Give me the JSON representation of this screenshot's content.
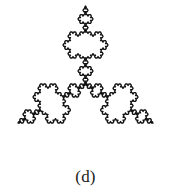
{
  "figure": {
    "caption": "(d)",
    "background_color": "#ffffff",
    "stroke_color": "#141414",
    "stroke_width": 1.35,
    "fill_color": "#ffffff"
  },
  "chart_data": {
    "type": "line",
    "subtitle": "(d)",
    "xlabel": "",
    "ylabel": "",
    "grid": false,
    "legend_position": "none",
    "annotations": [
      "(d)"
    ],
    "fractal": {
      "name": "Koch snowflake",
      "iterations": 4,
      "base_shape": "equilateral-triangle",
      "segments": 768,
      "orientation_degrees": -90,
      "center_x": 85.5,
      "center_y": 84.0,
      "circumradius": 78.0,
      "bounds": {
        "x_min": 13,
        "y_min": 3,
        "x_max": 158,
        "y_max": 163
      }
    }
  }
}
